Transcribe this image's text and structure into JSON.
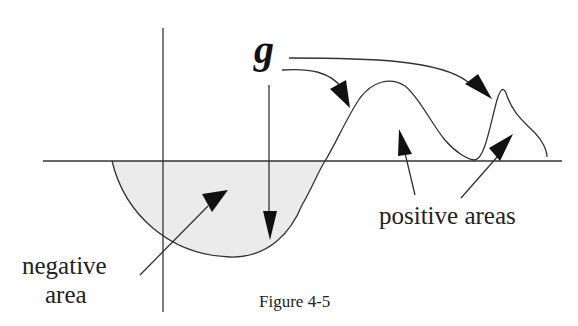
{
  "figure": {
    "function_label": "g",
    "negative_label_line1": "negative",
    "negative_label_line2": "area",
    "positive_label": "positive areas",
    "caption": "Figure 4-5"
  },
  "colors": {
    "line": "#333333",
    "fill_negative": "#ebebeb",
    "arrowhead": "#111111"
  }
}
